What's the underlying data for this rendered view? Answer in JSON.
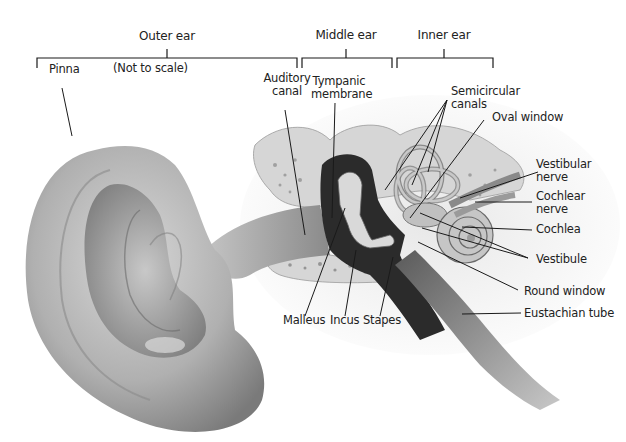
{
  "diagram": {
    "note": "(Not to scale)",
    "groups": [
      {
        "name": "Outer ear"
      },
      {
        "name": "Middle ear"
      },
      {
        "name": "Inner ear"
      }
    ],
    "labels": {
      "pinna": "Pinna",
      "auditory_canal_1": "Auditory",
      "auditory_canal_2": "canal",
      "tympanic_1": "Tympanic",
      "tympanic_2": "membrane",
      "semicircular_1": "Semicircular",
      "semicircular_2": "canals",
      "oval_window": "Oval window",
      "vestibular_1": "Vestibular",
      "vestibular_2": "nerve",
      "cochlear_1": "Cochlear",
      "cochlear_2": "nerve",
      "cochlea": "Cochlea",
      "vestibule": "Vestibule",
      "round_window": "Round window",
      "eustachian": "Eustachian tube",
      "malleus": "Malleus",
      "incus": "Incus",
      "stapes": "Stapes"
    },
    "colors": {
      "line": "#1a1a1a",
      "skin_light": "#e6e6e6",
      "skin_mid": "#b8b8b8",
      "skin_dark": "#6e6e6e",
      "cavity": "#2a2a2a",
      "bone": "#d4d4d4"
    }
  }
}
